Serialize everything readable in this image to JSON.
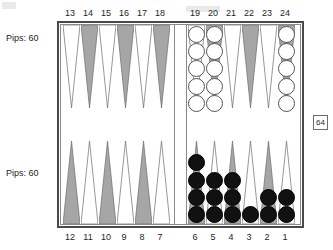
{
  "board": {
    "title": "Backgammon board position",
    "top_point_numbers": [
      "13",
      "14",
      "15",
      "16",
      "17",
      "18",
      "19",
      "20",
      "21",
      "22",
      "23",
      "24"
    ],
    "bottom_point_numbers": [
      "12",
      "11",
      "10",
      "9",
      "8",
      "7",
      "6",
      "5",
      "4",
      "3",
      "2",
      "1"
    ],
    "colors": {
      "point_light": "#ffffff",
      "point_dark": "#a6a6a6",
      "point_outline": "#6b6b6b",
      "frame": "#4a4a4a",
      "inner_border": "#8a8a8a",
      "white_checker": "#ffffff",
      "black_checker": "#111111",
      "background": "#ffffff",
      "text": "#1d1d1d"
    }
  },
  "players": {
    "top": {
      "pips_label": "Pips: 60",
      "pips_value": 60,
      "checker_color": "white"
    },
    "bottom": {
      "pips_label": "Pips: 60",
      "pips_value": 60,
      "checker_color": "black"
    }
  },
  "doubling_cube": {
    "value": "64",
    "position": "right-middle"
  },
  "points": [
    {
      "number": "13",
      "row": "top",
      "slot": 0,
      "shade": "light",
      "checkers": 0,
      "color": null
    },
    {
      "number": "14",
      "row": "top",
      "slot": 1,
      "shade": "dark",
      "checkers": 0,
      "color": null
    },
    {
      "number": "15",
      "row": "top",
      "slot": 2,
      "shade": "light",
      "checkers": 0,
      "color": null
    },
    {
      "number": "16",
      "row": "top",
      "slot": 3,
      "shade": "dark",
      "checkers": 0,
      "color": null
    },
    {
      "number": "17",
      "row": "top",
      "slot": 4,
      "shade": "light",
      "checkers": 0,
      "color": null
    },
    {
      "number": "18",
      "row": "top",
      "slot": 5,
      "shade": "dark",
      "checkers": 0,
      "color": null
    },
    {
      "number": "19",
      "row": "top",
      "slot": 6,
      "shade": "light",
      "checkers": 5,
      "color": "white"
    },
    {
      "number": "20",
      "row": "top",
      "slot": 7,
      "shade": "dark",
      "checkers": 5,
      "color": "white"
    },
    {
      "number": "21",
      "row": "top",
      "slot": 8,
      "shade": "light",
      "checkers": 0,
      "color": null
    },
    {
      "number": "22",
      "row": "top",
      "slot": 9,
      "shade": "dark",
      "checkers": 0,
      "color": null
    },
    {
      "number": "23",
      "row": "top",
      "slot": 10,
      "shade": "light",
      "checkers": 0,
      "color": null
    },
    {
      "number": "24",
      "row": "top",
      "slot": 11,
      "shade": "dark",
      "checkers": 5,
      "color": "white"
    },
    {
      "number": "12",
      "row": "bottom",
      "slot": 0,
      "shade": "dark",
      "checkers": 0,
      "color": null
    },
    {
      "number": "11",
      "row": "bottom",
      "slot": 1,
      "shade": "light",
      "checkers": 0,
      "color": null
    },
    {
      "number": "10",
      "row": "bottom",
      "slot": 2,
      "shade": "dark",
      "checkers": 0,
      "color": null
    },
    {
      "number": "9",
      "row": "bottom",
      "slot": 3,
      "shade": "light",
      "checkers": 0,
      "color": null
    },
    {
      "number": "8",
      "row": "bottom",
      "slot": 4,
      "shade": "dark",
      "checkers": 0,
      "color": null
    },
    {
      "number": "7",
      "row": "bottom",
      "slot": 5,
      "shade": "light",
      "checkers": 0,
      "color": null
    },
    {
      "number": "6",
      "row": "bottom",
      "slot": 6,
      "shade": "dark",
      "checkers": 4,
      "color": "black"
    },
    {
      "number": "5",
      "row": "bottom",
      "slot": 7,
      "shade": "light",
      "checkers": 3,
      "color": "black"
    },
    {
      "number": "4",
      "row": "bottom",
      "slot": 8,
      "shade": "dark",
      "checkers": 3,
      "color": "black"
    },
    {
      "number": "3",
      "row": "bottom",
      "slot": 9,
      "shade": "light",
      "checkers": 1,
      "color": "black"
    },
    {
      "number": "2",
      "row": "bottom",
      "slot": 10,
      "shade": "dark",
      "checkers": 2,
      "color": "black"
    },
    {
      "number": "1",
      "row": "bottom",
      "slot": 11,
      "shade": "light",
      "checkers": 2,
      "color": "black"
    }
  ],
  "bar": {
    "top_checkers": 0,
    "bottom_checkers": 0
  }
}
